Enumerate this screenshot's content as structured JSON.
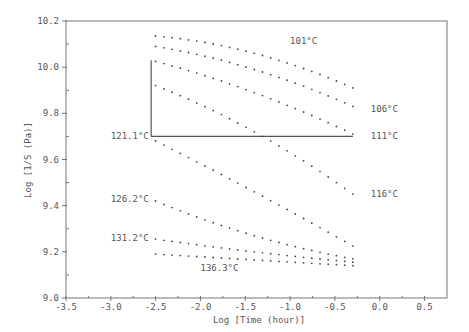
{
  "chart_data": {
    "type": "scatter",
    "title": "",
    "xlabel": "Log [Time (hour)]",
    "ylabel": "Log [1/S (Pa)]",
    "xlim": [
      -3.5,
      0.75
    ],
    "ylim": [
      9.0,
      10.2
    ],
    "x_ticks": [
      "-3.5",
      "-3.0",
      "-2.5",
      "-2.0",
      "-1.5",
      "-1.0",
      "-0.5",
      "0.0",
      "0.5"
    ],
    "x_tick_values": [
      -3.5,
      -3.0,
      -2.5,
      -2.0,
      -1.5,
      -1.0,
      -0.5,
      0.0,
      0.5
    ],
    "y_ticks": [
      "9.0",
      "9.2",
      "9.4",
      "9.6",
      "9.8",
      "10.0",
      "10.2"
    ],
    "y_tick_values": [
      9.0,
      9.2,
      9.4,
      9.6,
      9.8,
      10.0,
      10.2
    ],
    "grid": false,
    "legend": "inline labels",
    "series": [
      {
        "name": "101°C",
        "label_x": -1.0,
        "label_y": 10.115,
        "start": [
          -2.5,
          10.135
        ],
        "mid": [
          -1.4,
          10.06
        ],
        "end": [
          -0.3,
          9.91
        ]
      },
      {
        "name": "106°C",
        "label_x": -0.1,
        "label_y": 9.82,
        "start": [
          -2.5,
          10.09
        ],
        "mid": [
          -1.4,
          9.99
        ],
        "end": [
          -0.3,
          9.83
        ]
      },
      {
        "name": "111°C",
        "label_x": -0.1,
        "label_y": 9.7,
        "start": [
          -2.5,
          10.025
        ],
        "mid": [
          -1.4,
          9.89
        ],
        "end": [
          -0.3,
          9.71
        ]
      },
      {
        "name": "116°C",
        "label_x": -0.1,
        "label_y": 9.45,
        "start": [
          -2.5,
          9.92
        ],
        "mid": [
          -1.4,
          9.72
        ],
        "end": [
          -0.3,
          9.45
        ]
      },
      {
        "name": "121.1°C",
        "label_x": -3.0,
        "label_y": 9.7,
        "start": [
          -2.5,
          9.68
        ],
        "mid": [
          -1.4,
          9.46
        ],
        "end": [
          -0.3,
          9.225
        ]
      },
      {
        "name": "126.2°C",
        "label_x": -3.0,
        "label_y": 9.43,
        "start": [
          -2.5,
          9.42
        ],
        "mid": [
          -1.4,
          9.27
        ],
        "end": [
          -0.3,
          9.17
        ]
      },
      {
        "name": "131.2°C",
        "label_x": -3.0,
        "label_y": 9.26,
        "start": [
          -2.5,
          9.255
        ],
        "mid": [
          -1.4,
          9.2
        ],
        "end": [
          -0.3,
          9.155
        ]
      },
      {
        "name": "136.3°C",
        "label_x": -2.0,
        "label_y": 9.13,
        "start": [
          -2.5,
          9.19
        ],
        "mid": [
          -1.4,
          9.165
        ],
        "end": [
          -0.3,
          9.14
        ]
      }
    ],
    "annotations": {
      "vertical_line": {
        "x": -2.55,
        "y_from": 9.7,
        "y_to": 10.03
      },
      "horizontal_line": {
        "y": 9.7,
        "x_from": -2.55,
        "x_to": -0.3
      }
    }
  }
}
